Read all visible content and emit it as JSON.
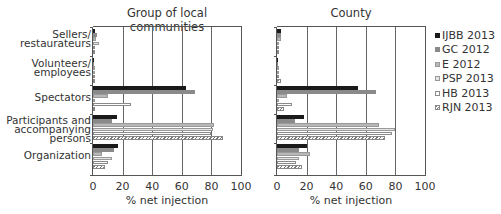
{
  "chart_data": [
    {
      "type": "bar",
      "orientation": "horizontal",
      "title": "Group of local communities",
      "xlabel": "% net injection",
      "ylabel": "",
      "xlim": [
        0,
        100
      ],
      "xticks": [
        "0",
        "20",
        "40",
        "60",
        "80",
        "100"
      ],
      "grid": "vertical",
      "categories": [
        "Sellers/ restaurateurs",
        "Volunteers/ employees",
        "Spectators",
        "Participants and accompanying persons",
        "Organization"
      ],
      "series": [
        {
          "name": "IJBB 2013",
          "values": [
            1.5,
            1,
            63,
            16,
            17
          ]
        },
        {
          "name": "GC 2012",
          "values": [
            2.5,
            0.3,
            69,
            13,
            14
          ]
        },
        {
          "name": "E 2012",
          "values": [
            2,
            0.3,
            10,
            82,
            6
          ]
        },
        {
          "name": "PSP 2013",
          "values": [
            4,
            0.3,
            1,
            81,
            13
          ]
        },
        {
          "name": "HB 2013",
          "values": [
            0.5,
            0.3,
            25.5,
            80,
            10
          ]
        },
        {
          "name": "RJN 2013",
          "values": [
            1.5,
            0.3,
            1,
            88,
            8
          ]
        }
      ]
    },
    {
      "type": "bar",
      "orientation": "horizontal",
      "title": "County",
      "xlabel": "% net injection",
      "ylabel": "",
      "xlim": [
        0,
        100
      ],
      "xticks": [
        "0",
        "20",
        "40",
        "60",
        "80",
        "100"
      ],
      "grid": "vertical",
      "categories": [
        "Sellers/ restaurateurs",
        "Volunteers/ employees",
        "Spectators",
        "Participants and accompanying persons",
        "Organization"
      ],
      "series": [
        {
          "name": "IJBB 2013",
          "values": [
            2.5,
            1,
            55,
            18,
            20
          ]
        },
        {
          "name": "GC 2012",
          "values": [
            2.5,
            0.3,
            67,
            12,
            15
          ]
        },
        {
          "name": "E 2012",
          "values": [
            2.5,
            0.3,
            7,
            69,
            22
          ]
        },
        {
          "name": "PSP 2013",
          "values": [
            1.5,
            0.3,
            1,
            80,
            15
          ]
        },
        {
          "name": "HB 2013",
          "values": [
            0.5,
            0.5,
            10,
            78,
            13
          ]
        },
        {
          "name": "RJN 2013",
          "values": [
            0.5,
            2.5,
            5,
            73,
            17
          ]
        }
      ]
    }
  ],
  "legend": {
    "position": "right",
    "items": [
      {
        "label": "IJBB 2013",
        "color": "#1a1a1a"
      },
      {
        "label": "GC 2012",
        "color": "#8a8a8a"
      },
      {
        "label": "E 2012",
        "color": "#b8b8b8"
      },
      {
        "label": "PSP 2013",
        "color": "#e4e4e4"
      },
      {
        "label": "HB 2013",
        "color": "#ffffff"
      },
      {
        "label": "RJN 2013",
        "color": "hatched"
      }
    ]
  },
  "labels": {
    "panel_left_title": "Group of local communities",
    "panel_right_title": "County",
    "xlabel": "% net injection",
    "cat0_l1": "Sellers/",
    "cat0_l2": "restaurateurs",
    "cat1_l1": "Volunteers/",
    "cat1_l2": "employees",
    "cat2_l1": "Spectators",
    "cat3_l1": "Participants and",
    "cat3_l2": "accompanying",
    "cat3_l3": "persons",
    "cat4_l1": "Organization",
    "ticks": [
      "0",
      "20",
      "40",
      "60",
      "80",
      "100"
    ]
  }
}
